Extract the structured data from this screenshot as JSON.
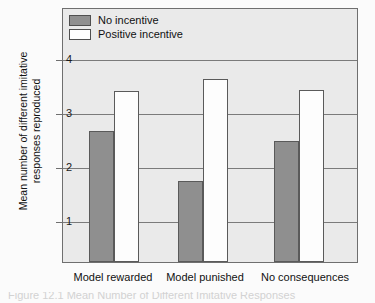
{
  "chart_data": {
    "type": "bar",
    "title": "",
    "xlabel": "",
    "ylabel": "Mean number of different imitative responses reproduced",
    "categories": [
      "Model rewarded",
      "Model punished",
      "No consequences"
    ],
    "series": [
      {
        "name": "No incentive",
        "color": "#8f8f8f",
        "values": [
          2.7,
          1.78,
          2.52
        ]
      },
      {
        "name": "Positive incentive",
        "color": "#ffffff",
        "values": [
          3.45,
          3.67,
          3.47
        ]
      }
    ],
    "ylim": [
      0,
      4.3
    ],
    "yticks": [
      1,
      2,
      3,
      4
    ],
    "ytick_labels": [
      "1",
      "2",
      "3",
      "4"
    ],
    "grid": true,
    "legend_position": "top-left",
    "plot_background": "#eaeaea"
  },
  "legend": {
    "items": [
      {
        "label": "No incentive",
        "swatch": "gray"
      },
      {
        "label": "Positive incentive",
        "swatch": "white"
      }
    ]
  },
  "axes": {
    "y_title": "Mean number of different imitative responses reproduced",
    "y_tick_labels": [
      "4",
      "3",
      "2",
      "1"
    ],
    "x_tick_labels": [
      "Model rewarded",
      "Model punished",
      "No consequences"
    ]
  },
  "caption": {
    "partial_text": "Figure 12.1 Mean Number of Different Imitative Responses"
  }
}
